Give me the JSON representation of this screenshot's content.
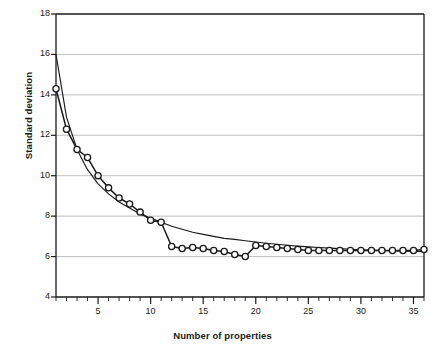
{
  "chart_data": {
    "type": "line",
    "title": "",
    "xlabel": "Number of properties",
    "ylabel": "Standard deviation",
    "xlim": [
      1,
      36
    ],
    "ylim": [
      4,
      18
    ],
    "grid": true,
    "grid_axis": "y",
    "legend": "none",
    "xticks": [
      5,
      10,
      15,
      20,
      25,
      30,
      35
    ],
    "xticks_minor_step": 1,
    "yticks": [
      4,
      6,
      8,
      10,
      12,
      14,
      16,
      18
    ],
    "x": [
      1,
      2,
      3,
      4,
      5,
      6,
      7,
      8,
      9,
      10,
      11,
      12,
      13,
      14,
      15,
      16,
      17,
      18,
      19,
      20,
      21,
      22,
      23,
      24,
      25,
      26,
      27,
      28,
      29,
      30,
      31,
      32,
      33,
      34,
      35,
      36
    ],
    "series": [
      {
        "name": "observed",
        "marker": "circle",
        "values": [
          14.3,
          12.3,
          11.3,
          10.9,
          10.0,
          9.4,
          8.9,
          8.6,
          8.2,
          7.8,
          7.7,
          6.5,
          6.4,
          6.45,
          6.4,
          6.3,
          6.25,
          6.1,
          6.0,
          6.55,
          6.5,
          6.45,
          6.4,
          6.35,
          6.3,
          6.3,
          6.3,
          6.3,
          6.3,
          6.3,
          6.3,
          6.3,
          6.3,
          6.3,
          6.3,
          6.35
        ]
      },
      {
        "name": "fitted",
        "marker": "none",
        "values": [
          16.0,
          12.9,
          11.3,
          10.3,
          9.6,
          9.1,
          8.7,
          8.4,
          8.1,
          7.9,
          7.7,
          7.5,
          7.35,
          7.2,
          7.1,
          7.0,
          6.9,
          6.85,
          6.78,
          6.72,
          6.66,
          6.61,
          6.56,
          6.52,
          6.48,
          6.45,
          6.42,
          6.39,
          6.36,
          6.34,
          6.32,
          6.3,
          6.28,
          6.27,
          6.26,
          6.25
        ]
      }
    ]
  },
  "axes": {
    "y_ticks": [
      "4",
      "6",
      "8",
      "10",
      "12",
      "14",
      "16",
      "18"
    ],
    "x_ticks": [
      "5",
      "10",
      "15",
      "20",
      "25",
      "30",
      "35"
    ]
  },
  "colors": {
    "line": "#1a1a1a",
    "grid": "#b9b9b9",
    "axis": "#1a1a1a",
    "marker_fill": "#ffffff",
    "background": "#ffffff"
  }
}
